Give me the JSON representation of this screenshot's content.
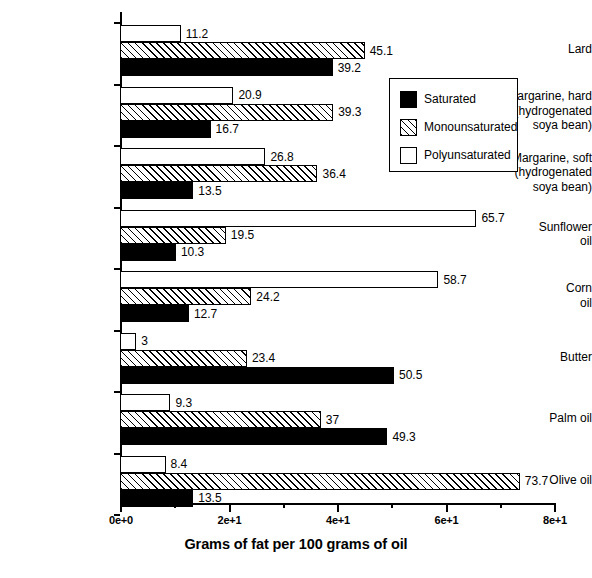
{
  "chart_data": {
    "type": "bar",
    "orientation": "horizontal",
    "title": "",
    "xlabel": "Grams of fat per 100 grams of oil",
    "ylabel": "",
    "xlim": [
      0,
      80
    ],
    "grid": false,
    "legend_position": "upper right",
    "x_tick_labels": [
      "0e+0",
      "2e+1",
      "4e+1",
      "6e+1",
      "8e+1"
    ],
    "x_tick_values": [
      0,
      20,
      40,
      60,
      80
    ],
    "x_minor_tick_values": [
      10,
      30,
      50,
      70
    ],
    "categories": [
      "Lard",
      "Margarine, hard\n(hydrogenated\nsoya bean)",
      "Margarine, soft\n(hydrogenated\nsoya bean)",
      "Sunflower\noil",
      "Corn\noil",
      "Butter",
      "Palm oil",
      "Olive oil"
    ],
    "series": [
      {
        "name": "Polyunsaturated",
        "fill": "white",
        "values": [
          11.2,
          20.9,
          26.8,
          65.7,
          58.7,
          3,
          9.3,
          8.4
        ],
        "labels": [
          "11.2",
          "20.9",
          "26.8",
          "65.7",
          "58.7",
          "3",
          "9.3",
          "8.4"
        ]
      },
      {
        "name": "Monounsaturated",
        "fill": "hatched",
        "values": [
          45.1,
          39.3,
          36.4,
          19.5,
          24.2,
          23.4,
          37,
          73.7
        ],
        "labels": [
          "45.1",
          "39.3",
          "36.4",
          "19.5",
          "24.2",
          "23.4",
          "37",
          "73.7"
        ]
      },
      {
        "name": "Saturated",
        "fill": "black",
        "values": [
          39.2,
          16.7,
          13.5,
          10.3,
          12.7,
          50.5,
          49.3,
          13.5
        ],
        "labels": [
          "39.2",
          "16.7",
          "13.5",
          "10.3",
          "12.7",
          "50.5",
          "49.3",
          "13.5"
        ]
      }
    ]
  },
  "legend": {
    "entries": [
      {
        "label": "Saturated",
        "swatch": "black"
      },
      {
        "label": "Monounsaturated",
        "swatch": "hatched"
      },
      {
        "label": "Polyunsaturated",
        "swatch": "white"
      }
    ]
  },
  "axis": {
    "x_title": "Grams of fat per 100 grams of oil"
  },
  "colors": {
    "foreground": "#000000",
    "background": "#ffffff"
  }
}
